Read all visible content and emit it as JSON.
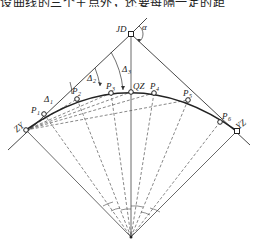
{
  "header": {
    "cropped_text": "设曲线的三个主点外，还要每隔一定的距"
  },
  "diagram": {
    "labels": {
      "jd": "JD",
      "alpha": "α",
      "zy": "ZY",
      "yz": "YZ",
      "qz": "QZ",
      "p1": "P",
      "p1_sub": "1",
      "p2": "P",
      "p2_sub": "2",
      "p3": "P",
      "p3_sub": "3",
      "p4": "P",
      "p4_sub": "4",
      "p5": "P",
      "p5_sub": "5",
      "p6": "P",
      "p6_sub": "6",
      "delta1": "Δ",
      "delta1_sub": "1",
      "delta2": "Δ",
      "delta2_sub": "2",
      "delta3": "Δ",
      "delta3_sub": "3"
    },
    "points": [
      "ZY",
      "P1",
      "P2",
      "P3",
      "QZ",
      "P4",
      "P5",
      "P6",
      "YZ"
    ],
    "colors": {
      "line": "#333333",
      "dashed": "#555555"
    }
  }
}
